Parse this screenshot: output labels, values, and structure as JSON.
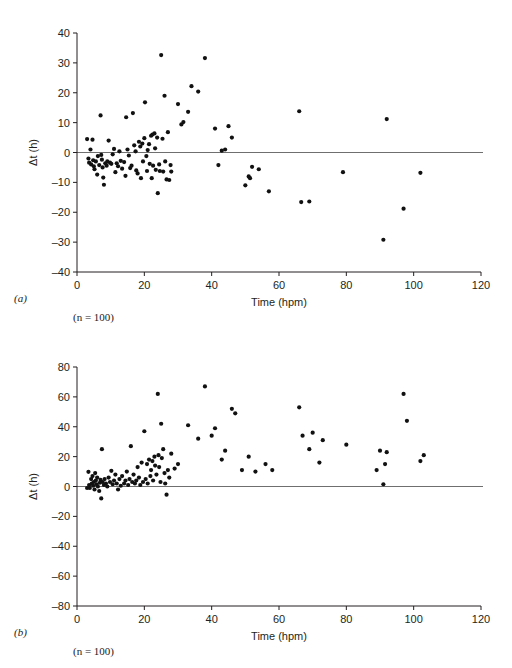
{
  "figure": {
    "background": "#ffffff",
    "point_color": "#111111",
    "axis_color": "#231f20",
    "zero_line_color": "#6f6f6f"
  },
  "panels": [
    {
      "id": "a",
      "panel_label": "(a)",
      "n_label_prefix": "(",
      "n_label_italic": "n",
      "n_label_suffix": " = 100)",
      "n_label": "(n = 100)"
    },
    {
      "id": "b",
      "panel_label": "(b)",
      "n_label_prefix": "(",
      "n_label_italic": "n",
      "n_label_suffix": " = 100)",
      "n_label": "(n = 100)"
    }
  ],
  "chart_data": [
    {
      "type": "scatter",
      "panel": "(a)",
      "title": "",
      "xlabel": "Time (hpm)",
      "ylabel": "Δt (h)",
      "xlim": [
        0,
        120
      ],
      "ylim": [
        -40,
        40
      ],
      "xticks": [
        0,
        20,
        40,
        60,
        80,
        100,
        120
      ],
      "yticks": [
        -40,
        -30,
        -20,
        -10,
        0,
        10,
        20,
        30,
        40
      ],
      "grid": false,
      "legend": "none",
      "annotations": [
        "(n = 100)"
      ],
      "reference_line_y": 0,
      "n": 100,
      "points": [
        [
          3.0,
          4.5
        ],
        [
          3.4,
          -2.0
        ],
        [
          3.6,
          -3.4
        ],
        [
          4.0,
          1.0
        ],
        [
          4.2,
          -4.0
        ],
        [
          4.6,
          4.3
        ],
        [
          4.8,
          -2.6
        ],
        [
          5.0,
          -4.6
        ],
        [
          5.2,
          -5.6
        ],
        [
          5.6,
          -3.0
        ],
        [
          6.0,
          -7.4
        ],
        [
          6.2,
          -1.2
        ],
        [
          6.6,
          -4.2
        ],
        [
          7.0,
          12.4
        ],
        [
          7.2,
          -0.8
        ],
        [
          7.4,
          -2.4
        ],
        [
          7.6,
          -5.0
        ],
        [
          7.8,
          -8.4
        ],
        [
          8.0,
          -10.8
        ],
        [
          8.4,
          -3.6
        ],
        [
          8.8,
          -4.4
        ],
        [
          9.0,
          -3.0
        ],
        [
          9.4,
          4.0
        ],
        [
          9.8,
          -3.4
        ],
        [
          10.2,
          -3.8
        ],
        [
          10.6,
          -0.6
        ],
        [
          11.0,
          1.2
        ],
        [
          11.4,
          -6.6
        ],
        [
          11.8,
          -3.6
        ],
        [
          12.2,
          -4.6
        ],
        [
          12.6,
          0.4
        ],
        [
          13.0,
          -2.8
        ],
        [
          13.4,
          -5.4
        ],
        [
          14.0,
          -3.2
        ],
        [
          14.4,
          -7.8
        ],
        [
          14.6,
          11.8
        ],
        [
          15.0,
          1.0
        ],
        [
          15.4,
          -1.0
        ],
        [
          15.8,
          -5.2
        ],
        [
          16.2,
          -4.4
        ],
        [
          16.6,
          13.2
        ],
        [
          17.0,
          2.4
        ],
        [
          17.4,
          0.4
        ],
        [
          17.6,
          -6.0
        ],
        [
          18.0,
          -7.0
        ],
        [
          18.4,
          3.6
        ],
        [
          18.8,
          2.0
        ],
        [
          19.0,
          -8.6
        ],
        [
          19.4,
          3.0
        ],
        [
          19.6,
          -3.0
        ],
        [
          20.0,
          4.8
        ],
        [
          20.2,
          16.8
        ],
        [
          20.6,
          -1.2
        ],
        [
          20.8,
          -6.2
        ],
        [
          21.0,
          0.8
        ],
        [
          21.4,
          2.8
        ],
        [
          21.6,
          -3.8
        ],
        [
          22.0,
          5.6
        ],
        [
          22.2,
          -8.6
        ],
        [
          22.4,
          6.0
        ],
        [
          22.6,
          -4.4
        ],
        [
          23.0,
          6.4
        ],
        [
          23.2,
          1.4
        ],
        [
          23.4,
          -5.8
        ],
        [
          23.8,
          5.0
        ],
        [
          24.0,
          -13.6
        ],
        [
          24.4,
          -4.0
        ],
        [
          24.6,
          -6.2
        ],
        [
          25.0,
          32.6
        ],
        [
          25.4,
          4.6
        ],
        [
          25.6,
          -6.4
        ],
        [
          26.0,
          19.0
        ],
        [
          26.2,
          -3.0
        ],
        [
          26.6,
          -9.0
        ],
        [
          27.0,
          6.8
        ],
        [
          27.4,
          -9.2
        ],
        [
          27.8,
          -4.2
        ],
        [
          28.0,
          -6.4
        ],
        [
          30.0,
          16.2
        ],
        [
          31.0,
          9.4
        ],
        [
          31.6,
          10.2
        ],
        [
          33.0,
          13.6
        ],
        [
          34.0,
          22.2
        ],
        [
          36.0,
          20.4
        ],
        [
          38.0,
          31.6
        ],
        [
          41.0,
          8.0
        ],
        [
          42.0,
          -4.2
        ],
        [
          43.0,
          0.6
        ],
        [
          44.0,
          1.0
        ],
        [
          45.0,
          8.8
        ],
        [
          46.0,
          5.0
        ],
        [
          50.0,
          -11.0
        ],
        [
          51.0,
          -8.0
        ],
        [
          51.4,
          -8.6
        ],
        [
          52.0,
          -4.8
        ],
        [
          54.0,
          -5.6
        ],
        [
          57.0,
          -13.0
        ],
        [
          66.0,
          13.8
        ],
        [
          66.6,
          -16.6
        ],
        [
          69.0,
          -16.4
        ],
        [
          79.0,
          -6.6
        ],
        [
          91.0,
          -29.2
        ],
        [
          92.0,
          11.2
        ],
        [
          97.0,
          -18.8
        ],
        [
          102.0,
          -6.8
        ]
      ]
    },
    {
      "type": "scatter",
      "panel": "(b)",
      "title": "",
      "xlabel": "Time (hpm)",
      "ylabel": "Δt (h)",
      "xlim": [
        0,
        120
      ],
      "ylim": [
        -80,
        80
      ],
      "xticks": [
        0,
        20,
        40,
        60,
        80,
        100,
        120
      ],
      "yticks": [
        -80,
        -60,
        -40,
        -20,
        0,
        20,
        40,
        60,
        80
      ],
      "grid": false,
      "legend": "none",
      "annotations": [
        "(n = 100)"
      ],
      "reference_line_y": 0,
      "n": 100,
      "points": [
        [
          3.0,
          -1.0
        ],
        [
          3.4,
          9.8
        ],
        [
          3.6,
          1.0
        ],
        [
          3.8,
          -1.0
        ],
        [
          4.2,
          5.0
        ],
        [
          4.4,
          2.0
        ],
        [
          4.6,
          7.0
        ],
        [
          4.8,
          0.5
        ],
        [
          5.0,
          3.0
        ],
        [
          5.2,
          -2.0
        ],
        [
          5.4,
          9.0
        ],
        [
          5.6,
          4.0
        ],
        [
          5.8,
          1.5
        ],
        [
          6.0,
          6.0
        ],
        [
          6.2,
          0.0
        ],
        [
          6.6,
          -3.0
        ],
        [
          6.8,
          2.5
        ],
        [
          7.0,
          4.4
        ],
        [
          7.2,
          -8.0
        ],
        [
          7.4,
          25.0
        ],
        [
          7.6,
          3.0
        ],
        [
          8.0,
          1.0
        ],
        [
          8.2,
          5.0
        ],
        [
          8.6,
          2.0
        ],
        [
          9.0,
          0.0
        ],
        [
          9.4,
          6.0
        ],
        [
          9.8,
          3.0
        ],
        [
          10.2,
          10.5
        ],
        [
          10.6,
          1.5
        ],
        [
          11.0,
          4.0
        ],
        [
          11.4,
          8.0
        ],
        [
          11.8,
          2.0
        ],
        [
          12.2,
          -2.0
        ],
        [
          12.6,
          5.0
        ],
        [
          13.0,
          0.5
        ],
        [
          13.4,
          7.0
        ],
        [
          14.0,
          2.0
        ],
        [
          14.4,
          4.0
        ],
        [
          14.8,
          10.0
        ],
        [
          15.2,
          1.0
        ],
        [
          15.6,
          5.0
        ],
        [
          16.0,
          27.0
        ],
        [
          16.4,
          3.0
        ],
        [
          16.8,
          8.0
        ],
        [
          17.2,
          2.0
        ],
        [
          17.6,
          4.0
        ],
        [
          18.0,
          13.0
        ],
        [
          18.4,
          6.0
        ],
        [
          18.8,
          1.0
        ],
        [
          19.2,
          16.0
        ],
        [
          19.6,
          3.0
        ],
        [
          20.0,
          37.0
        ],
        [
          20.4,
          5.0
        ],
        [
          20.8,
          15.0
        ],
        [
          21.0,
          2.0
        ],
        [
          21.4,
          18.0
        ],
        [
          21.8,
          7.0
        ],
        [
          22.0,
          11.0
        ],
        [
          22.4,
          17.0
        ],
        [
          22.6,
          4.0
        ],
        [
          23.0,
          20.0
        ],
        [
          23.2,
          14.0
        ],
        [
          23.6,
          8.0
        ],
        [
          24.0,
          62.0
        ],
        [
          24.2,
          21.0
        ],
        [
          24.4,
          13.0
        ],
        [
          24.8,
          3.0
        ],
        [
          25.0,
          42.0
        ],
        [
          25.2,
          19.0
        ],
        [
          25.6,
          25.0
        ],
        [
          26.0,
          9.0
        ],
        [
          26.2,
          2.0
        ],
        [
          26.6,
          -5.5
        ],
        [
          27.0,
          11.0
        ],
        [
          27.4,
          6.0
        ],
        [
          28.0,
          22.0
        ],
        [
          29.0,
          12.0
        ],
        [
          30.0,
          15.0
        ],
        [
          33.0,
          41.0
        ],
        [
          36.0,
          32.0
        ],
        [
          38.0,
          67.0
        ],
        [
          40.0,
          34.0
        ],
        [
          41.0,
          39.0
        ],
        [
          43.0,
          18.0
        ],
        [
          44.0,
          24.0
        ],
        [
          46.0,
          52.0
        ],
        [
          47.0,
          49.0
        ],
        [
          49.0,
          11.0
        ],
        [
          51.0,
          20.0
        ],
        [
          53.0,
          10.0
        ],
        [
          56.0,
          15.0
        ],
        [
          58.0,
          11.0
        ],
        [
          66.0,
          53.0
        ],
        [
          67.0,
          34.0
        ],
        [
          69.0,
          25.0
        ],
        [
          70.0,
          36.0
        ],
        [
          72.0,
          16.0
        ],
        [
          73.0,
          31.0
        ],
        [
          80.0,
          28.0
        ],
        [
          89.0,
          11.0
        ],
        [
          90.0,
          24.0
        ],
        [
          91.0,
          1.5
        ],
        [
          91.5,
          15.0
        ],
        [
          92.0,
          23.0
        ],
        [
          97.0,
          62.0
        ],
        [
          98.0,
          44.0
        ],
        [
          102.0,
          17.0
        ],
        [
          103.0,
          21.0
        ]
      ]
    }
  ]
}
